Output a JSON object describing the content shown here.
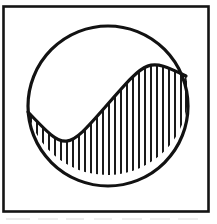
{
  "figure": {
    "title": "Yin-yang style circle divided by an S-curve with vertical hatching",
    "canvas": {
      "width": 217,
      "height": 224
    },
    "background_color": "#ffffff",
    "ink_color": "#111111",
    "frame": {
      "name": "rectangular border frame",
      "x": 3.5,
      "y": 6.5,
      "width": 205,
      "height": 205,
      "stroke_color": "#141414",
      "stroke_width": 2.6,
      "fill": "none"
    },
    "circle": {
      "name": "outer circle",
      "cx": 108,
      "cy": 106,
      "r": 80,
      "stroke_color": "#121212",
      "stroke_width": 3.2,
      "fill": "none"
    },
    "divider_curve": {
      "name": "S-shaped dividing curve",
      "description": "Sigmoid curve from the left edge of the circle up to the right edge of the circle, passing through the circle center",
      "start_point": [
        28,
        112
      ],
      "control_point_1": [
        66,
        152
      ],
      "mid_point": [
        107,
        105
      ],
      "control_point_2": [
        148,
        58
      ],
      "end_point": [
        186,
        76
      ],
      "stroke_color": "#121212",
      "stroke_width": 3.2,
      "fill": "none"
    },
    "hatching": {
      "name": "vertical line hatch fill of lower-right region",
      "orientation": "vertical",
      "spacing_px": 6,
      "line_width_px": 1.7,
      "stroke_color": "#1a1a1a",
      "line_count": 27,
      "region": "area of the circle below and to the right of the S-curve"
    },
    "scan_artifacts": {
      "name": "faint gray scan smudge below the frame",
      "color": "#d8d8d8",
      "y": 218,
      "height": 3
    }
  }
}
